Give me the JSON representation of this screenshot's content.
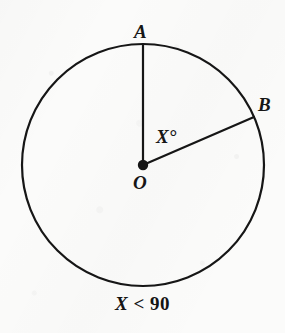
{
  "figure": {
    "kind": "circle-central-angle-diagram",
    "background_color": "#fbfbfa",
    "ink_color": "#161616",
    "circle": {
      "center_label": "O",
      "center_x": 143,
      "center_y": 165,
      "radius": 121,
      "stroke_width": 2
    },
    "points": [
      {
        "name": "A",
        "label": "A",
        "x": 143,
        "y": 44,
        "position": "top of circle"
      },
      {
        "name": "B",
        "label": "B",
        "x": 254,
        "y": 117,
        "position": "upper right of circle"
      },
      {
        "name": "O",
        "label": "O",
        "x": 143,
        "y": 165,
        "position": "center",
        "marker": "filled-dot"
      }
    ],
    "radii": [
      {
        "name": "OA",
        "from": "O",
        "to": "A"
      },
      {
        "name": "OB",
        "from": "O",
        "to": "B"
      }
    ],
    "angle": {
      "vertex": "O",
      "rays": [
        "OA",
        "OB"
      ],
      "label": "X°",
      "measure_degrees": 67
    },
    "caption": {
      "variable": "X",
      "relation": "<",
      "value": "90",
      "full_text": "X < 90"
    }
  }
}
